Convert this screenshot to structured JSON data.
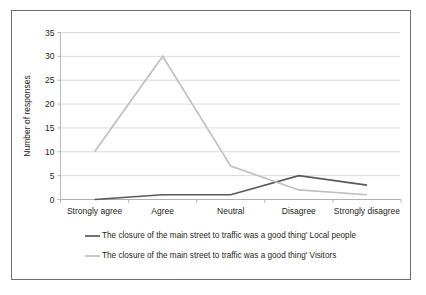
{
  "chart_data": {
    "type": "line",
    "title": "",
    "xlabel": "",
    "ylabel": "Number of responses",
    "categories": [
      "Strongly agree",
      "Agree",
      "Neutral",
      "Disagree",
      "Strongly disagree"
    ],
    "yticks": [
      0,
      5,
      10,
      15,
      20,
      25,
      30,
      35
    ],
    "ylim": [
      0,
      35
    ],
    "grid": true,
    "legend_position": "bottom-left",
    "series": [
      {
        "name": "The closure of the main street to traffic was a good thing' Local people",
        "color": "#595959",
        "values": [
          0,
          1,
          1,
          5,
          3
        ]
      },
      {
        "name": "The closure of the main street to traffic was a good thing' Visitors",
        "color": "#bfbfbf",
        "values": [
          10,
          30,
          7,
          2,
          1
        ]
      }
    ]
  },
  "axes": {
    "y_title": "Number of responses",
    "y_tick_labels": [
      "0",
      "5",
      "10",
      "15",
      "20",
      "25",
      "30",
      "35"
    ],
    "x_tick_labels": [
      "Strongly agree",
      "Agree",
      "Neutral",
      "Disagree",
      "Strongly disagree"
    ]
  },
  "legend": {
    "entries": [
      {
        "label": "The closure of the main street to traffic was a good thing' Local people",
        "color": "#595959"
      },
      {
        "label": "The closure of the main street to traffic was a good thing' Visitors",
        "color": "#bfbfbf"
      }
    ]
  }
}
